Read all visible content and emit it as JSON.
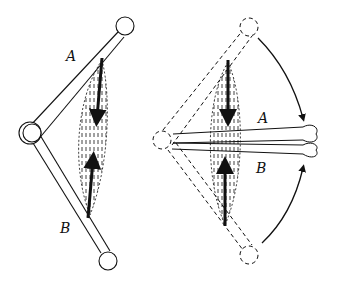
{
  "figure": {
    "left_panel": {
      "label_a": "A",
      "label_b": "B",
      "state": "extended"
    },
    "right_panel": {
      "label_a": "A",
      "label_b": "B",
      "state": "contracted"
    }
  },
  "colors": {
    "line": "#111111",
    "background": "#ffffff"
  }
}
